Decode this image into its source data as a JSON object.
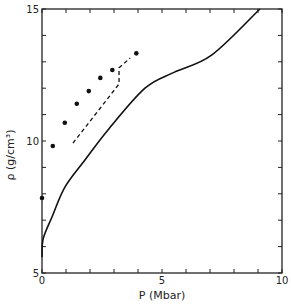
{
  "chart_data": {
    "type": "line",
    "title": "",
    "xlabel": "P (Mbar)",
    "ylabel": "ρ (g/cm³)",
    "xlim": [
      0,
      10
    ],
    "ylim": [
      5,
      15
    ],
    "x_ticks": [
      0,
      5,
      10
    ],
    "y_ticks": [
      5,
      10,
      15
    ],
    "x_minor_step": 1,
    "y_minor_step": 1,
    "grid": false,
    "legend": null,
    "series": [
      {
        "name": "solid curve",
        "style": "solid",
        "x": [
          0,
          0.05,
          0.42,
          0.96,
          1.79,
          2.75,
          4.29,
          5.5,
          7.08,
          9.08
        ],
        "y": [
          5.6,
          6.3,
          7.13,
          8.26,
          9.28,
          10.42,
          12.0,
          12.6,
          13.26,
          15.0
        ]
      },
      {
        "name": "dashed curve",
        "style": "dashed",
        "x": [
          1.29,
          3.21,
          3.21,
          3.67
        ],
        "y": [
          9.92,
          12.16,
          12.77,
          13.14
        ]
      },
      {
        "name": "data points",
        "style": "markers",
        "x": [
          0,
          0.45,
          0.95,
          1.45,
          1.95,
          2.43,
          2.93,
          3.93
        ],
        "y": [
          7.84,
          9.81,
          10.69,
          11.41,
          11.89,
          12.39,
          12.69,
          13.32
        ]
      }
    ]
  },
  "labels": {
    "x_axis": "P (Mbar)",
    "y_axis": "ρ (g/cm³)",
    "x_ticks": [
      "0",
      "5",
      "10"
    ],
    "y_ticks": [
      "5",
      "10",
      "15"
    ]
  }
}
